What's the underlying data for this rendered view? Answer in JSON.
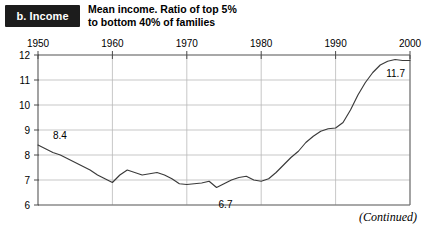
{
  "figure": {
    "badge_label": "b. Income",
    "title_line1": "Mean income. Ratio of top 5%",
    "title_line2": "to bottom 40% of families",
    "footer_note": "(Continued)"
  },
  "colors": {
    "badge_background": "#1c1c1c",
    "badge_text": "#ffffff",
    "line": "#3a3a3a",
    "gridline": "#b9b9b9",
    "axis": "#6e6e6e",
    "background": "#ffffff"
  },
  "chart_data": {
    "type": "line",
    "title": "Mean income. Ratio of top 5% to bottom 40% of families",
    "xlabel": "",
    "ylabel": "",
    "xlim": [
      1950,
      2000
    ],
    "ylim": [
      6,
      12
    ],
    "xticks": [
      1950,
      1960,
      1970,
      1980,
      1990,
      2000
    ],
    "xtick_labels": [
      "1950",
      "1960",
      "1970",
      "1980",
      "1990",
      "2000"
    ],
    "yticks": [
      6,
      7,
      8,
      9,
      10,
      11,
      12
    ],
    "ytick_labels": [
      "6",
      "7",
      "8",
      "9",
      "10",
      "11",
      "12"
    ],
    "grid": true,
    "xaxis_position": "top",
    "legend": "none",
    "annotations": [
      {
        "text": "8.4",
        "x": 1951.2,
        "y": 8.42,
        "dx": 6,
        "dy": -6
      },
      {
        "text": "6.7",
        "x": 1974.0,
        "y": 6.7,
        "dx": 2,
        "dy": 20
      },
      {
        "text": "11.7",
        "x": 1996.0,
        "y": 11.7,
        "dx": 6,
        "dy": 14
      }
    ],
    "series": [
      {
        "name": "Ratio of top 5% to bottom 40% of families",
        "x": [
          1950,
          1951,
          1952,
          1953,
          1954,
          1955,
          1956,
          1957,
          1958,
          1959,
          1960,
          1961,
          1962,
          1963,
          1964,
          1965,
          1966,
          1967,
          1968,
          1969,
          1970,
          1971,
          1972,
          1973,
          1974,
          1975,
          1976,
          1977,
          1978,
          1979,
          1980,
          1981,
          1982,
          1983,
          1984,
          1985,
          1986,
          1987,
          1988,
          1989,
          1990,
          1991,
          1992,
          1993,
          1994,
          1995,
          1996,
          1997,
          1998,
          1999,
          2000
        ],
        "values": [
          8.4,
          8.25,
          8.1,
          8.0,
          7.85,
          7.7,
          7.55,
          7.4,
          7.2,
          7.05,
          6.9,
          7.2,
          7.4,
          7.3,
          7.2,
          7.25,
          7.3,
          7.2,
          7.05,
          6.85,
          6.82,
          6.85,
          6.88,
          6.95,
          6.7,
          6.85,
          7.0,
          7.1,
          7.15,
          7.0,
          6.95,
          7.05,
          7.3,
          7.6,
          7.9,
          8.15,
          8.5,
          8.75,
          8.95,
          9.05,
          9.08,
          9.3,
          9.8,
          10.4,
          10.9,
          11.3,
          11.6,
          11.75,
          11.82,
          11.78,
          11.78
        ]
      }
    ]
  }
}
